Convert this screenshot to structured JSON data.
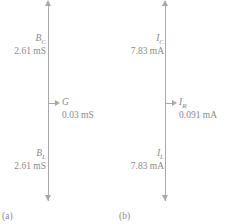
{
  "figure": {
    "panels": [
      {
        "caption": "(a)",
        "axis_icon": "vertical-double-arrow",
        "top_label": {
          "symbol": "B",
          "subscript": "C",
          "value": "2.61 mS"
        },
        "mid_label": {
          "symbol": "G",
          "subscript": "",
          "value": "0.03 mS"
        },
        "bottom_label": {
          "symbol": "B",
          "subscript": "L",
          "value": "2.61 mS"
        }
      },
      {
        "caption": "(b)",
        "axis_icon": "vertical-double-arrow",
        "top_label": {
          "symbol": "I",
          "subscript": "C",
          "value": "7.83 mA"
        },
        "mid_label": {
          "symbol": "I",
          "subscript": "R",
          "value": "0.091 mA"
        },
        "bottom_label": {
          "symbol": "I",
          "subscript": "L",
          "value": "7.83 mA"
        }
      }
    ],
    "colors": {
      "line": "#a8a8a8",
      "text": "#8a8a8a",
      "background": "#ffffff"
    }
  },
  "chart_data": {
    "type": "diagram",
    "subtype": "phasor-diagram",
    "title": "",
    "panels": [
      {
        "label": "(a)",
        "quantity": "admittance components",
        "unit": "mS",
        "components": [
          {
            "name": "B_C",
            "direction": "up",
            "magnitude": 2.61,
            "display": "2.61 mS"
          },
          {
            "name": "G",
            "direction": "right",
            "magnitude": 0.03,
            "display": "0.03 mS"
          },
          {
            "name": "B_L",
            "direction": "down",
            "magnitude": 2.61,
            "display": "2.61 mS"
          }
        ]
      },
      {
        "label": "(b)",
        "quantity": "branch currents",
        "unit": "mA",
        "components": [
          {
            "name": "I_C",
            "direction": "up",
            "magnitude": 7.83,
            "display": "7.83 mA"
          },
          {
            "name": "I_R",
            "direction": "right",
            "magnitude": 0.091,
            "display": "0.091 mA"
          },
          {
            "name": "I_L",
            "direction": "down",
            "magnitude": 7.83,
            "display": "7.83 mA"
          }
        ]
      }
    ]
  }
}
